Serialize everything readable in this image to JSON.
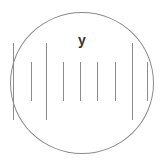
{
  "magnifier": {
    "label": "y",
    "colors": {
      "border": "#8a8a8a",
      "tick": "#8c8c8c",
      "label": "#333333",
      "background": "#ffffff"
    },
    "ticks": [
      {
        "x": 13,
        "type": "long"
      },
      {
        "x": 31,
        "type": "short"
      },
      {
        "x": 46,
        "type": "long"
      },
      {
        "x": 63,
        "type": "short"
      },
      {
        "x": 80,
        "type": "short"
      },
      {
        "x": 97,
        "type": "short"
      },
      {
        "x": 115,
        "type": "short"
      },
      {
        "x": 132,
        "type": "long"
      },
      {
        "x": 147,
        "type": "short"
      }
    ]
  }
}
